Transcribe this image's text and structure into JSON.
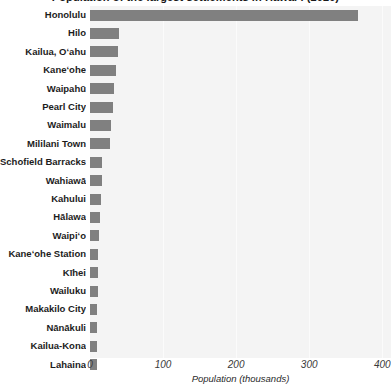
{
  "chart_data": {
    "type": "bar",
    "orientation": "horizontal",
    "title": "Population of the largest settlements in Hawaiʻi (2020)",
    "xlabel": "Population  (thousands)",
    "ylabel": "",
    "xlim": [
      0,
      412
    ],
    "xticks": [
      0,
      100,
      200,
      300,
      400
    ],
    "xtick_labels": [
      "0",
      "100",
      "200",
      "300",
      "400"
    ],
    "grid": true,
    "legend": false,
    "bar_color": "#808080",
    "plot_background": "#f4f4f4",
    "categories": [
      "Honolulu",
      "Hilo",
      "Kailua, Oʻahu",
      "Kaneʻohe",
      "Waipahū",
      "Pearl City",
      "Waimalu",
      "Mililani Town",
      "Schofield Barracks",
      "Wahiawā",
      "Kahului",
      "Hālawa",
      "Waipiʻo",
      "Kaneʻohe Station",
      "Kīhei",
      "Wailuku",
      "Makakilo City",
      "Nānākuli",
      "Kailua-Kona"
    ],
    "values": [
      367,
      40,
      38,
      35,
      33,
      31,
      29,
      28,
      17,
      17,
      15,
      14,
      12,
      11,
      11,
      11,
      10,
      10,
      9
    ],
    "extra_category": "Lahaina",
    "extra_value": 9
  },
  "axis": {
    "x_title": "Population  (thousands)",
    "ticks": [
      {
        "label": "0",
        "value": 0
      },
      {
        "label": "100",
        "value": 100
      },
      {
        "label": "200",
        "value": 200
      },
      {
        "label": "300",
        "value": 300
      },
      {
        "label": "400",
        "value": 400
      }
    ]
  }
}
